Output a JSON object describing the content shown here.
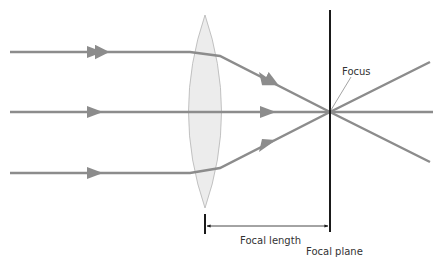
{
  "diagram": {
    "labels": {
      "focus": "Focus",
      "focal_length": "Focal length",
      "focal_plane": "Focal plane"
    },
    "colors": {
      "ray": "#8c8c8c",
      "lens_fill": "#ececec",
      "lens_stroke": "#b4b4b4",
      "plane": "#1a1a1a"
    },
    "elements": [
      "incoming ray (top)",
      "incoming ray (middle)",
      "incoming ray (bottom)",
      "convex lens",
      "focal plane",
      "focus point",
      "focal length dimension"
    ]
  }
}
